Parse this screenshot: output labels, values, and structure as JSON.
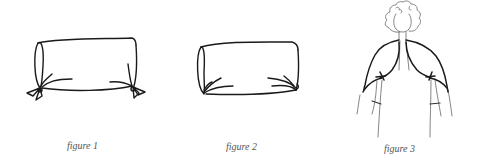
{
  "figures": [
    {
      "caption": "figure 1",
      "depicts": "bolster pillow tied at both ends"
    },
    {
      "caption": "figure 2",
      "depicts": "bolster pillow with gathered ends"
    },
    {
      "caption": "figure 3",
      "depicts": "figure wearing a shrug/bolero wrap"
    }
  ],
  "colors": {
    "line": "#1a1a1a",
    "thin_line": "#777777",
    "caption": "#555555",
    "background": "#ffffff"
  }
}
